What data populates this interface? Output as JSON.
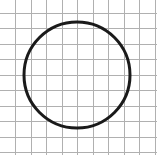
{
  "figure": {
    "grid": {
      "spacing_px": 15.5,
      "line_color": "#b0b0b0",
      "background": "#ffffff",
      "columns": 10,
      "rows": 10,
      "width_px": 157,
      "height_px": 155
    },
    "circle": {
      "cx": 77,
      "cy": 75,
      "r": 53,
      "stroke": "#1a1a1a",
      "stroke_width": 3
    }
  }
}
